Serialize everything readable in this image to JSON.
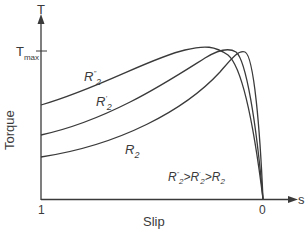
{
  "diagram": {
    "title": "",
    "y_axis": {
      "label": "Torque",
      "symbol": "T",
      "tick_label": "T",
      "tick_sub": "max"
    },
    "x_axis": {
      "label": "Slip",
      "symbol": "s",
      "left_tick": "1",
      "right_tick": "0"
    },
    "curves": [
      {
        "name": "R2''",
        "base": "R",
        "sub": "2",
        "sup": "''",
        "start_torque_px": 105,
        "peak_x_px": 200
      },
      {
        "name": "R2'",
        "base": "R",
        "sub": "2",
        "sup": "'",
        "start_torque_px": 135,
        "peak_x_px": 225
      },
      {
        "name": "R2",
        "base": "R",
        "sub": "2",
        "sup": "",
        "start_torque_px": 157,
        "peak_x_px": 240
      }
    ],
    "relation": {
      "text": "R''2>R'2>R2",
      "p1": "R",
      "s1": "''",
      "d1": "2",
      "g1": ">",
      "p2": "R",
      "s2": "'",
      "d2": "2",
      "g2": ">",
      "p3": "R",
      "d3": "2"
    },
    "line_color": "#3a3a3a"
  }
}
